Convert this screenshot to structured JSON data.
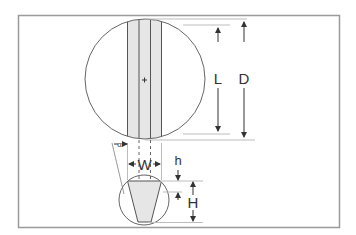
{
  "diagram": {
    "labels": {
      "L": "L",
      "D": "D",
      "W": "W",
      "h": "h",
      "H": "H",
      "alpha": "α"
    },
    "colors": {
      "frame": "#9a9a9a",
      "line": "#555555",
      "fill": "#e6e6e6",
      "guide": "#bdbdbd"
    }
  }
}
